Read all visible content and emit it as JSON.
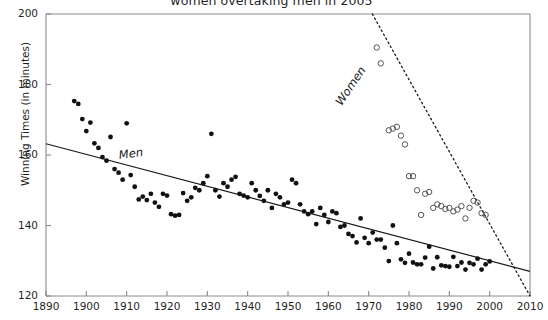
{
  "chart_data": {
    "type": "scatter",
    "title": "women overtaking men in 2005",
    "xlabel": "",
    "ylabel": "Winning Times (in minutes)",
    "xlim": [
      1890,
      2010
    ],
    "ylim": [
      120,
      200
    ],
    "xticks": [
      1890,
      1900,
      1910,
      1920,
      1930,
      1940,
      1950,
      1960,
      1970,
      1980,
      1990,
      2000,
      2010
    ],
    "yticks": [
      120,
      140,
      160,
      180,
      200
    ],
    "grid": false,
    "legend": "inline-annotations",
    "annotations": [
      {
        "text": "Men",
        "x": 1917,
        "y": 156,
        "rotation": -7
      },
      {
        "text": "Women",
        "x": 1972,
        "y": 182,
        "rotation": -56
      }
    ],
    "series": [
      {
        "name": "Men",
        "marker": "filled-circle",
        "color": "#111111",
        "trendline": {
          "style": "solid",
          "x": [
            1890,
            2010
          ],
          "y": [
            163.2,
            127.0
          ]
        },
        "points": [
          [
            1897,
            175.3
          ],
          [
            1898,
            174.5
          ],
          [
            1899,
            170.2
          ],
          [
            1900,
            166.8
          ],
          [
            1901,
            169.2
          ],
          [
            1902,
            163.3
          ],
          [
            1903,
            162.0
          ],
          [
            1904,
            159.4
          ],
          [
            1905,
            158.4
          ],
          [
            1906,
            165.1
          ],
          [
            1907,
            156.0
          ],
          [
            1908,
            155.0
          ],
          [
            1909,
            153.0
          ],
          [
            1910,
            169.0
          ],
          [
            1911,
            154.3
          ],
          [
            1912,
            151.0
          ],
          [
            1913,
            147.4
          ],
          [
            1914,
            148.2
          ],
          [
            1915,
            147.2
          ],
          [
            1916,
            149.0
          ],
          [
            1917,
            146.5
          ],
          [
            1918,
            145.3
          ],
          [
            1919,
            149.0
          ],
          [
            1920,
            148.5
          ],
          [
            1921,
            143.2
          ],
          [
            1922,
            142.8
          ],
          [
            1923,
            143.0
          ],
          [
            1924,
            149.2
          ],
          [
            1925,
            147.0
          ],
          [
            1926,
            148.0
          ],
          [
            1927,
            150.7
          ],
          [
            1928,
            150.0
          ],
          [
            1929,
            152.0
          ],
          [
            1930,
            154.0
          ],
          [
            1931,
            166.0
          ],
          [
            1932,
            150.0
          ],
          [
            1933,
            148.2
          ],
          [
            1934,
            152.0
          ],
          [
            1935,
            151.0
          ],
          [
            1936,
            153.0
          ],
          [
            1937,
            153.8
          ],
          [
            1938,
            149.0
          ],
          [
            1939,
            148.5
          ],
          [
            1940,
            148.0
          ],
          [
            1941,
            152.0
          ],
          [
            1942,
            150.0
          ],
          [
            1943,
            148.4
          ],
          [
            1944,
            147.0
          ],
          [
            1945,
            150.0
          ],
          [
            1946,
            145.0
          ],
          [
            1947,
            149.0
          ],
          [
            1948,
            148.0
          ],
          [
            1949,
            146.0
          ],
          [
            1950,
            146.5
          ],
          [
            1951,
            153.0
          ],
          [
            1952,
            152.0
          ],
          [
            1953,
            146.0
          ],
          [
            1954,
            144.0
          ],
          [
            1955,
            143.2
          ],
          [
            1956,
            144.0
          ],
          [
            1957,
            140.4
          ],
          [
            1958,
            145.0
          ],
          [
            1959,
            143.0
          ],
          [
            1960,
            141.0
          ],
          [
            1961,
            144.0
          ],
          [
            1962,
            143.5
          ],
          [
            1963,
            139.6
          ],
          [
            1964,
            140.0
          ],
          [
            1965,
            137.6
          ],
          [
            1966,
            137.0
          ],
          [
            1967,
            135.2
          ],
          [
            1968,
            142.0
          ],
          [
            1969,
            136.5
          ],
          [
            1970,
            135.0
          ],
          [
            1971,
            138.0
          ],
          [
            1972,
            136.0
          ],
          [
            1973,
            136.0
          ],
          [
            1974,
            133.7
          ],
          [
            1975,
            129.9
          ],
          [
            1976,
            140.0
          ],
          [
            1977,
            135.0
          ],
          [
            1978,
            130.4
          ],
          [
            1979,
            129.4
          ],
          [
            1980,
            132.0
          ],
          [
            1981,
            129.5
          ],
          [
            1982,
            129.0
          ],
          [
            1983,
            129.0
          ],
          [
            1984,
            130.9
          ],
          [
            1985,
            134.0
          ],
          [
            1986,
            127.8
          ],
          [
            1987,
            131.0
          ],
          [
            1988,
            128.7
          ],
          [
            1989,
            128.5
          ],
          [
            1990,
            128.3
          ],
          [
            1991,
            131.1
          ],
          [
            1992,
            128.5
          ],
          [
            1993,
            129.5
          ],
          [
            1994,
            127.5
          ],
          [
            1995,
            129.4
          ],
          [
            1996,
            129.0
          ],
          [
            1997,
            130.6
          ],
          [
            1998,
            127.5
          ],
          [
            1999,
            129.0
          ],
          [
            2000,
            129.8
          ]
        ]
      },
      {
        "name": "Women",
        "marker": "open-circle",
        "color": "#555555",
        "trendline": {
          "style": "dotted",
          "x": [
            1967,
            2010
          ],
          "y": [
            208.0,
            120.0
          ]
        },
        "points": [
          [
            1972,
            190.5
          ],
          [
            1973,
            186.0
          ],
          [
            1975,
            167.0
          ],
          [
            1976,
            167.5
          ],
          [
            1977,
            168.0
          ],
          [
            1978,
            165.5
          ],
          [
            1979,
            163.0
          ],
          [
            1980,
            154.0
          ],
          [
            1981,
            154.0
          ],
          [
            1982,
            150.0
          ],
          [
            1983,
            143.0
          ],
          [
            1984,
            149.0
          ],
          [
            1985,
            149.5
          ],
          [
            1986,
            145.0
          ],
          [
            1987,
            146.0
          ],
          [
            1988,
            145.5
          ],
          [
            1989,
            144.7
          ],
          [
            1990,
            145.0
          ],
          [
            1991,
            144.0
          ],
          [
            1992,
            144.5
          ],
          [
            1993,
            145.5
          ],
          [
            1994,
            142.0
          ],
          [
            1995,
            145.0
          ],
          [
            1996,
            147.0
          ],
          [
            1997,
            146.5
          ],
          [
            1998,
            143.5
          ],
          [
            1999,
            143.0
          ]
        ]
      }
    ]
  }
}
